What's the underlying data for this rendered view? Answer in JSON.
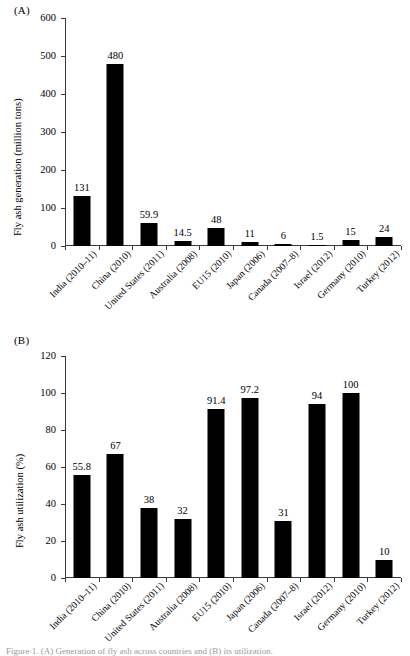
{
  "figure": {
    "panel_a_label": "(A)",
    "panel_b_label": "(B)",
    "bottom_caption": "Figure 1. (A) Generation of fly ash across countries and (B) its utilization."
  },
  "chart_data": [
    {
      "type": "bar",
      "panel": "(A)",
      "title": "",
      "xlabel": "",
      "ylabel": "Fly ash generation (million tons)",
      "ylim": [
        0,
        600
      ],
      "yticks": [
        0,
        100,
        200,
        300,
        400,
        500,
        600
      ],
      "ytick_labels": [
        "0",
        "100",
        "200",
        "300",
        "400",
        "500",
        "600"
      ],
      "grid": false,
      "legend": "none",
      "bar_color": "#000000",
      "categories": [
        "India (2010–11)",
        "China (2010)",
        "United States (2011)",
        "Australia (2008)",
        "EU15 (2010)",
        "Japan (2006)",
        "Canada (2007–8)",
        "Israel (2012)",
        "Germany (2010)",
        "Turkey (2012)"
      ],
      "values": [
        131,
        480,
        59.9,
        14.5,
        48,
        11,
        6,
        1.5,
        15,
        24
      ],
      "value_labels": [
        "131",
        "480",
        "59.9",
        "14.5",
        "48",
        "11",
        "6",
        "1.5",
        "15",
        "24"
      ]
    },
    {
      "type": "bar",
      "panel": "(B)",
      "title": "",
      "xlabel": "",
      "ylabel": "Fly ash utilization (%)",
      "ylim": [
        0,
        120
      ],
      "yticks": [
        0,
        20,
        40,
        60,
        80,
        100,
        120
      ],
      "ytick_labels": [
        "0",
        "20",
        "40",
        "60",
        "80",
        "100",
        "120"
      ],
      "grid": false,
      "legend": "none",
      "bar_color": "#000000",
      "categories": [
        "India (2010–11)",
        "China (2010)",
        "United States (2011)",
        "Australia (2008)",
        "EU15 (2010)",
        "Japan (2006)",
        "Canada (2007–8)",
        "Israel (2012)",
        "Germany (2010)",
        "Turkey (2012)"
      ],
      "values": [
        55.8,
        67,
        38,
        32,
        91.4,
        97.2,
        31,
        94,
        100,
        10
      ],
      "value_labels": [
        "55.8",
        "67",
        "38",
        "32",
        "91.4",
        "97.2",
        "31",
        "94",
        "100",
        "10"
      ]
    }
  ]
}
